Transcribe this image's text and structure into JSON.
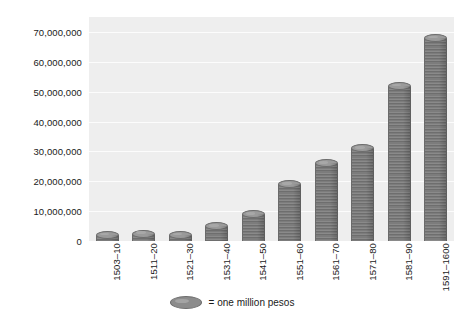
{
  "chart_data": {
    "type": "bar",
    "title": "",
    "subtitle": "",
    "xlabel": "",
    "ylabel": "",
    "categories": [
      "1503–10",
      "1511–20",
      "1521–30",
      "1531–40",
      "1541–50",
      "1551–60",
      "1561–70",
      "1571–80",
      "1581–90",
      "1591–1600"
    ],
    "values": [
      2000000,
      2500000,
      2000000,
      5000000,
      9000000,
      19000000,
      26000000,
      31000000,
      52000000,
      68000000
    ],
    "ylim": [
      0,
      75000000
    ],
    "ytick_values": [
      0,
      10000000,
      20000000,
      30000000,
      40000000,
      50000000,
      60000000,
      70000000
    ],
    "ytick_labels": [
      "0",
      "10,000,000",
      "20,000,000",
      "30,000,000",
      "40,000,000",
      "50,000,000",
      "60,000,000",
      "70,000,000"
    ],
    "grid": true,
    "legend_position": "bottom",
    "legend": [
      {
        "symbol": "coin-stack-ellipse",
        "label": "= one million pesos"
      }
    ],
    "series": [
      {
        "name": "Treasure imports",
        "values": [
          2000000,
          2500000,
          2000000,
          5000000,
          9000000,
          19000000,
          26000000,
          31000000,
          52000000,
          68000000
        ]
      }
    ],
    "annotations": [],
    "colors": {
      "plot_background": "#eeeeee",
      "gridline": "#fcfcfc",
      "bar_fill": "#7c7c7c",
      "bar_highlight": "#9a9a9a",
      "bar_outline": "#6a6a6a",
      "text": "#1a1a1a",
      "figure_background": "#ffffff"
    }
  },
  "legend": {
    "swatch_name": "coin-stack-ellipse",
    "text": "= one million pesos"
  }
}
